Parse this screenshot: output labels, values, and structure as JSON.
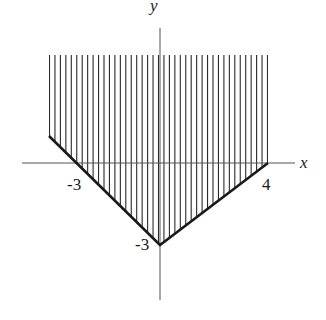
{
  "chart_data": {
    "type": "area",
    "title": "",
    "xlabel": "x",
    "ylabel": "y",
    "boundary": [
      {
        "x": -4,
        "y": 1
      },
      {
        "x": -3,
        "y": 0
      },
      {
        "x": 0,
        "y": -3
      },
      {
        "x": 4,
        "y": 0
      }
    ],
    "region": {
      "x_min": -4,
      "x_max": 4,
      "y_min_boundary": "piecewise line",
      "y_max": "unbounded (shown to ~4)"
    },
    "annotations": [
      {
        "text": "-3",
        "at": "x-intercept left",
        "x": -3,
        "y": 0
      },
      {
        "text": "4",
        "at": "x-intercept right",
        "x": 4,
        "y": 0
      },
      {
        "text": "-3",
        "at": "y-intercept",
        "x": 0,
        "y": -3
      }
    ],
    "grid": false,
    "legend": null
  },
  "labels": {
    "x_axis": "x",
    "y_axis": "y",
    "x_intercept_left": "-3",
    "x_intercept_right": "4",
    "y_intercept": "-3"
  },
  "colors": {
    "ink": "#1a1a1a",
    "hatch": "#2a2a2a",
    "axis": "#555555",
    "background": "#ffffff"
  }
}
